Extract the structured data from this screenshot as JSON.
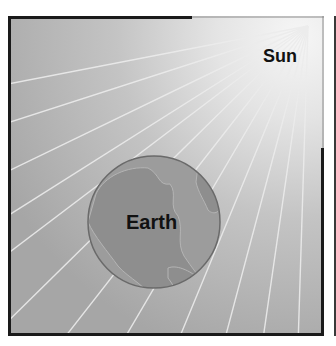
{
  "diagram": {
    "labels": {
      "sun": "Sun",
      "earth": "Earth"
    },
    "colors": {
      "background_dark": "#a8a8a8",
      "background_light": "#f2f2f2",
      "ray": "#e6e6e6",
      "earth_fill": "#9c9c9c",
      "earth_land": "#8d8d8d",
      "earth_outline": "#6a6a6a",
      "frame": "#1a1a1a"
    }
  }
}
